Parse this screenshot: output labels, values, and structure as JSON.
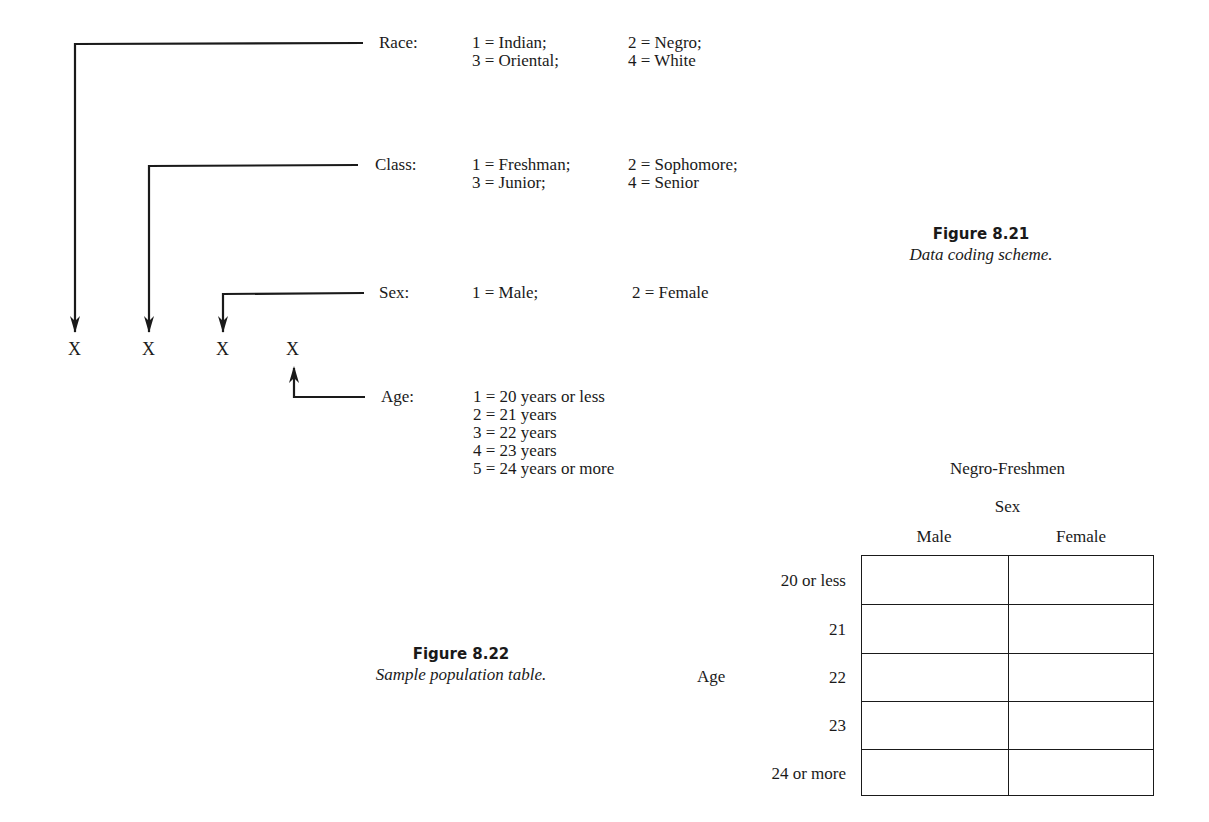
{
  "figure_821": {
    "title": "Figure 8.21",
    "caption": "Data coding scheme.",
    "positions": [
      "X",
      "X",
      "X",
      "X"
    ],
    "fields": [
      {
        "label": "Race:",
        "codes": [
          [
            "1 = Indian;",
            "2 = Negro;"
          ],
          [
            "3 = Oriental;",
            "4 = White"
          ]
        ]
      },
      {
        "label": "Class:",
        "codes": [
          [
            "1 = Freshman;",
            "2 = Sophomore;"
          ],
          [
            "3 = Junior;",
            "4 = Senior"
          ]
        ]
      },
      {
        "label": "Sex:",
        "codes": [
          [
            "1 = Male;",
            "2 = Female"
          ]
        ]
      },
      {
        "label": "Age:",
        "codes": [
          [
            "1 = 20 years or less"
          ],
          [
            "2 = 21 years"
          ],
          [
            "3 = 22 years"
          ],
          [
            "4 = 23 years"
          ],
          [
            "5 = 24 years or more"
          ]
        ]
      }
    ]
  },
  "figure_822": {
    "title": "Figure 8.22",
    "caption": "Sample population table.",
    "table": {
      "group_title": "Negro-Freshmen",
      "column_group_label": "Sex",
      "columns": [
        "Male",
        "Female"
      ],
      "row_group_label": "Age",
      "rows": [
        "20 or less",
        "21",
        "22",
        "23",
        "24 or more"
      ],
      "cells": [
        [
          "",
          ""
        ],
        [
          "",
          ""
        ],
        [
          "",
          ""
        ],
        [
          "",
          ""
        ],
        [
          "",
          ""
        ]
      ]
    }
  },
  "colors": {
    "ink": "#1a1a1a",
    "background": "#ffffff"
  }
}
